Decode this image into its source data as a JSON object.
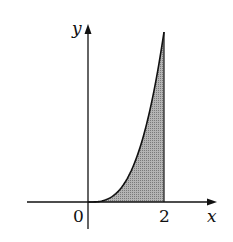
{
  "chart_data": {
    "type": "area",
    "title": "",
    "xlabel": "x",
    "ylabel": "y",
    "function": "y = x^3",
    "x_ticks": [
      {
        "value": 0,
        "label": "0"
      },
      {
        "value": 2,
        "label": "2"
      }
    ],
    "shaded_region": {
      "from": 0,
      "to": 2,
      "description": "area under curve between x=0 and x=2"
    },
    "x": [
      0,
      0.25,
      0.5,
      0.75,
      1,
      1.25,
      1.5,
      1.75,
      2
    ],
    "series": [
      {
        "name": "curve",
        "values": [
          0,
          0.016,
          0.125,
          0.422,
          1,
          1.953,
          3.375,
          5.359,
          8
        ]
      }
    ],
    "xlim": [
      -0.8,
      3.4
    ],
    "ylim": [
      -0.3,
      8.3
    ],
    "grid": false,
    "legend": "none"
  },
  "labels": {
    "x_axis": "x",
    "y_axis": "y",
    "origin": "0",
    "tick_2": "2"
  },
  "colors": {
    "axis": "#111111",
    "fill": "#a8a8a8",
    "curve": "#111111"
  }
}
